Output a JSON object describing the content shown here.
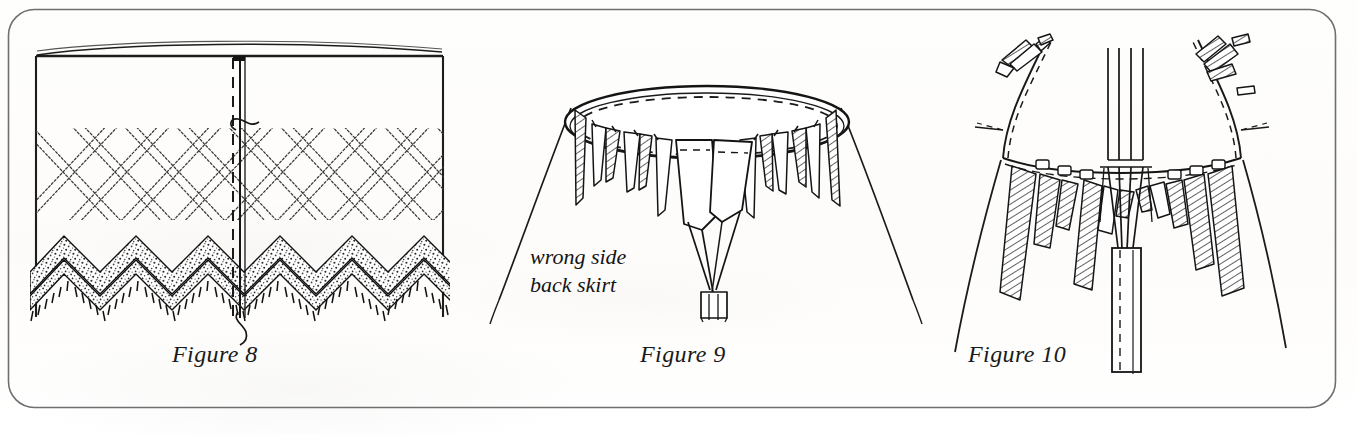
{
  "page": {
    "kind": "scanned-book-page",
    "width": 1357,
    "height": 435,
    "background_color": "#fdfdfc",
    "ink_color": "#1a1a1a"
  },
  "frame": {
    "name": "rounded-panel-border",
    "shape": "rounded-rectangle",
    "stroke_color": "#6f6f6f",
    "corner_radius": 26,
    "x": 8,
    "y": 9,
    "w": 1328,
    "h": 399
  },
  "figures": [
    {
      "id": "figure-8",
      "caption": "Figure 8",
      "subject": "flat skirt panel with lattice ribbon trim, zigzag lace hem and basting thread at center seam",
      "elements": [
        "fabric-panel-outline",
        "center-seam-solid-line",
        "center-seam-dashed-stitch-line",
        "needle-thread-curl-top",
        "needle-thread-curl-bottom",
        "lattice-ribbon-band",
        "zigzag-lace-hem-band",
        "fringe-edge"
      ]
    },
    {
      "id": "figure-9",
      "caption": "Figure 9",
      "subject": "skirt viewed from above showing wrong side of back skirt with pleats pinned around waist ellipse",
      "annotation": "wrong side\nback skirt",
      "annotation_lines": [
        "wrong side",
        "back skirt"
      ],
      "elements": [
        "waist-ellipse-solid",
        "waist-ellipse-dashed-stitch",
        "pleat-tabs-hatched",
        "center-back-vent",
        "skirt-body-outline"
      ]
    },
    {
      "id": "figure-10",
      "caption": "Figure 10",
      "subject": "close up of gathered waistline with hatched pleats, centre-back placket and tie ends",
      "elements": [
        "waistband-seam-line",
        "waistband-dashed-stitch-line",
        "hatched-pleat-flaps",
        "center-back-placket",
        "placket-dashed-stitch-line",
        "tie-straps",
        "skirt-side-outlines"
      ]
    }
  ],
  "captions": {
    "figure_8": "Figure 8",
    "figure_9": "Figure 9",
    "figure_10": "Figure 10"
  },
  "annotations": {
    "wrong_side_line1": "wrong side",
    "wrong_side_line2": "back skirt"
  }
}
